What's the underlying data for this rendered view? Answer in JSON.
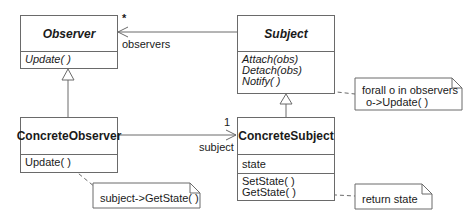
{
  "diagram": {
    "type": "UML class diagram",
    "classes": {
      "observer": {
        "name": "Observer",
        "abstract": true,
        "attributes": [],
        "operations": [
          "Update( )"
        ]
      },
      "subject": {
        "name": "Subject",
        "abstract": true,
        "attributes": [],
        "operations": [
          "Attach(obs)",
          "Detach(obs)",
          "Notify( )"
        ]
      },
      "concrete_observer": {
        "name": "ConcreteObserver",
        "abstract": false,
        "attributes": [],
        "operations": [
          "Update( )"
        ]
      },
      "concrete_subject": {
        "name": "ConcreteSubject",
        "abstract": false,
        "attributes": [
          "state"
        ],
        "operations": [
          "SetState( )",
          "GetState( )"
        ]
      }
    },
    "associations": {
      "subject_to_observer": {
        "role": "observers",
        "multiplicity": "*"
      },
      "concreteobserver_to_concretesubject": {
        "role": "subject",
        "multiplicity": "1"
      }
    },
    "notes": {
      "notify": {
        "lines": [
          "forall o in observers",
          "o->Update( )"
        ]
      },
      "update": {
        "lines": [
          "subject->GetState( )"
        ]
      },
      "getstate": {
        "lines": [
          "return state"
        ]
      }
    },
    "colors": {
      "line": "#6a6a6a",
      "text": "#1a1a1a",
      "background": "#ffffff"
    }
  }
}
